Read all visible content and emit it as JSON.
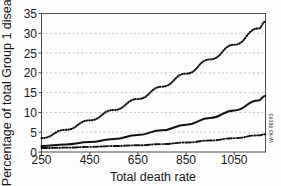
{
  "figure": {
    "credit": "WHO 96093",
    "partial_title": ""
  },
  "chart_data": {
    "type": "line",
    "title": "",
    "xlabel": "Total death rate",
    "ylabel": "Percentage of total Group 1 diseases",
    "xlim": [
      250,
      1180
    ],
    "ylim": [
      0,
      35
    ],
    "xticks": [
      250,
      450,
      650,
      850,
      1050
    ],
    "yticks": [
      0,
      5,
      10,
      15,
      20,
      25,
      30,
      35
    ],
    "xtick_labels": [
      "250",
      "450",
      "650",
      "850",
      "1050"
    ],
    "ytick_labels": [
      "0",
      "5",
      "10",
      "15",
      "20",
      "25",
      "30",
      "35"
    ],
    "grid": "horizontal-dashed",
    "legend": "none",
    "x": [
      250,
      350,
      450,
      550,
      650,
      750,
      850,
      950,
      1050,
      1150,
      1180
    ],
    "series": [
      {
        "name": "upper-dotted",
        "style": "dotted",
        "values": [
          3.5,
          5.6,
          8.0,
          10.6,
          13.4,
          16.5,
          19.8,
          23.4,
          27.1,
          31.2,
          32.9
        ]
      },
      {
        "name": "middle-solid",
        "style": "solid",
        "values": [
          1.5,
          1.9,
          2.5,
          3.3,
          4.3,
          5.5,
          6.9,
          8.6,
          10.5,
          13.0,
          14.2
        ]
      },
      {
        "name": "lower-dash-dot",
        "style": "dash-dot",
        "values": [
          1.0,
          1.1,
          1.3,
          1.5,
          1.7,
          2.0,
          2.4,
          2.9,
          3.5,
          4.2,
          4.5
        ]
      }
    ]
  }
}
